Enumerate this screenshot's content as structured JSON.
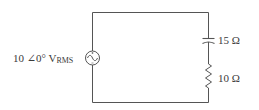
{
  "diagram": {
    "type": "series AC circuit",
    "source": {
      "magnitude": "10",
      "angle": "∠0°",
      "unit": "V",
      "unit_subscript": "RMS",
      "symbol": "ac-voltage-source"
    },
    "capacitor": {
      "label": "15 Ω",
      "symbol": "capacitor"
    },
    "resistor": {
      "label": "10 Ω",
      "symbol": "resistor"
    },
    "colors": {
      "wire": "#555555",
      "text": "#3a3a3a",
      "background": "#ffffff"
    }
  }
}
